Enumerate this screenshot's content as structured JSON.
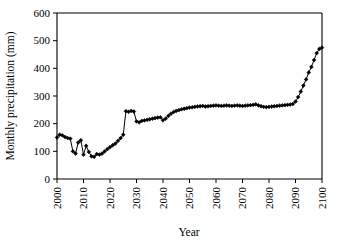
{
  "chart_data": {
    "type": "line",
    "title": "",
    "xlabel": "Year",
    "ylabel": "Monthly precipitation (mm)",
    "xlim": [
      2000,
      2100
    ],
    "ylim": [
      0,
      600
    ],
    "xticks": [
      2000,
      2010,
      2020,
      2030,
      2040,
      2050,
      2060,
      2070,
      2080,
      2090,
      2100
    ],
    "yticks": [
      0,
      100,
      200,
      300,
      400,
      500,
      600
    ],
    "xtick_labels": [
      "2000",
      "2010",
      "2020",
      "2030",
      "2040",
      "2050",
      "2060",
      "2070",
      "2080",
      "2090",
      "2100"
    ],
    "ytick_labels": [
      "0",
      "100",
      "200",
      "300",
      "400",
      "500",
      "600"
    ],
    "grid": false,
    "legend": false,
    "marker": "diamond",
    "marker_color": "#000000",
    "line_color": "#000000",
    "xtick_rotation": 90,
    "series": [
      {
        "name": "Monthly precipitation",
        "x": [
          2000,
          2001,
          2002,
          2003,
          2004,
          2005,
          2006,
          2007,
          2008,
          2009,
          2010,
          2011,
          2012,
          2013,
          2014,
          2015,
          2016,
          2017,
          2018,
          2019,
          2020,
          2021,
          2022,
          2023,
          2024,
          2025,
          2026,
          2027,
          2028,
          2029,
          2030,
          2031,
          2032,
          2033,
          2034,
          2035,
          2036,
          2037,
          2038,
          2039,
          2040,
          2041,
          2042,
          2043,
          2044,
          2045,
          2046,
          2047,
          2048,
          2049,
          2050,
          2051,
          2052,
          2053,
          2054,
          2055,
          2056,
          2057,
          2058,
          2059,
          2060,
          2061,
          2062,
          2063,
          2064,
          2065,
          2066,
          2067,
          2068,
          2069,
          2070,
          2071,
          2072,
          2073,
          2074,
          2075,
          2076,
          2077,
          2078,
          2079,
          2080,
          2081,
          2082,
          2083,
          2084,
          2085,
          2086,
          2087,
          2088,
          2089,
          2090,
          2091,
          2092,
          2093,
          2094,
          2095,
          2096,
          2097,
          2098,
          2099,
          2100
        ],
        "y": [
          150,
          160,
          158,
          152,
          148,
          146,
          100,
          92,
          132,
          140,
          88,
          120,
          98,
          82,
          80,
          90,
          88,
          92,
          100,
          108,
          115,
          122,
          128,
          138,
          148,
          160,
          245,
          243,
          246,
          244,
          208,
          205,
          210,
          212,
          214,
          216,
          218,
          220,
          222,
          223,
          212,
          218,
          228,
          236,
          242,
          246,
          249,
          252,
          254,
          256,
          258,
          259,
          261,
          262,
          263,
          264,
          262,
          263,
          264,
          265,
          266,
          265,
          264,
          265,
          266,
          265,
          264,
          265,
          266,
          265,
          264,
          265,
          266,
          267,
          268,
          270,
          266,
          263,
          261,
          260,
          261,
          262,
          263,
          264,
          265,
          266,
          267,
          268,
          269,
          271,
          280,
          296,
          316,
          338,
          360,
          385,
          405,
          430,
          455,
          470,
          475
        ]
      }
    ]
  },
  "axis": {
    "ylabel": "Monthly precipitation (mm)",
    "xlabel": "Year"
  }
}
